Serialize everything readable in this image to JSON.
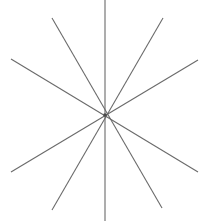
{
  "canvas": {
    "width": 203,
    "height": 221,
    "background_color": "#ffffff",
    "border": "none"
  },
  "figure": {
    "name": "radial-star-line-figure",
    "center": {
      "x": 105,
      "y": 115
    },
    "ray_count": 10,
    "line_count": 5,
    "stroke_color": "#6a6a6a",
    "stroke_width": 1.1,
    "center_dot": {
      "visible": true,
      "color": "#4a4a4a",
      "radius": 1.8
    }
  },
  "chart_data": {
    "type": "line",
    "title": "",
    "subtitle": "",
    "xlabel": "",
    "ylabel": "",
    "grid": false,
    "legend": "none",
    "axis_visible": false,
    "tick_labels": [],
    "annotations": [],
    "xlim": [
      0,
      203
    ],
    "ylim": [
      0,
      221
    ],
    "center": {
      "x": 105,
      "y": 115
    },
    "series": [
      {
        "name": "vertical-line",
        "stroke": "#6a6a6a",
        "points": [
          {
            "x": 105,
            "y": 0
          },
          {
            "x": 105,
            "y": 221
          }
        ]
      },
      {
        "name": "steep-line-nw-se",
        "stroke": "#6a6a6a",
        "points": [
          {
            "x": 52,
            "y": 18
          },
          {
            "x": 162,
            "y": 208
          }
        ]
      },
      {
        "name": "steep-line-ne-sw",
        "stroke": "#6a6a6a",
        "points": [
          {
            "x": 163,
            "y": 18
          },
          {
            "x": 52,
            "y": 210
          }
        ]
      },
      {
        "name": "shallow-line-wnw-ese",
        "stroke": "#6a6a6a",
        "points": [
          {
            "x": 11,
            "y": 59
          },
          {
            "x": 198,
            "y": 172
          }
        ]
      },
      {
        "name": "shallow-line-ene-wsw",
        "stroke": "#6a6a6a",
        "points": [
          {
            "x": 198,
            "y": 60
          },
          {
            "x": 11,
            "y": 172
          }
        ]
      }
    ],
    "rays": [
      {
        "name": "ray-north",
        "endpoint": {
          "x": 105,
          "y": 0
        }
      },
      {
        "name": "ray-north-east",
        "endpoint": {
          "x": 163,
          "y": 18
        }
      },
      {
        "name": "ray-east-upper",
        "endpoint": {
          "x": 198,
          "y": 60
        }
      },
      {
        "name": "ray-east-lower",
        "endpoint": {
          "x": 198,
          "y": 172
        }
      },
      {
        "name": "ray-south-east",
        "endpoint": {
          "x": 162,
          "y": 208
        }
      },
      {
        "name": "ray-south",
        "endpoint": {
          "x": 105,
          "y": 221
        }
      },
      {
        "name": "ray-south-west",
        "endpoint": {
          "x": 52,
          "y": 210
        }
      },
      {
        "name": "ray-west-lower",
        "endpoint": {
          "x": 11,
          "y": 172
        }
      },
      {
        "name": "ray-west-upper",
        "endpoint": {
          "x": 11,
          "y": 59
        }
      },
      {
        "name": "ray-north-west",
        "endpoint": {
          "x": 52,
          "y": 18
        }
      }
    ]
  }
}
